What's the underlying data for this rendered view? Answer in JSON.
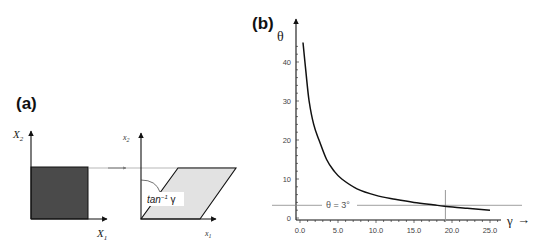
{
  "panel_a": {
    "label": "(a)",
    "left_axes": {
      "y_label": "X",
      "y_sub": "2",
      "x_label": "X",
      "x_sub": "1"
    },
    "right_axes": {
      "y_label": "x",
      "y_sub": "2",
      "x_label": "x",
      "x_sub": "1"
    },
    "angle_label": "tan",
    "angle_sup": "−1",
    "angle_var": " γ",
    "colors": {
      "square_fill": "#4a4a4a",
      "parallelogram_fill": "#e2e2e2",
      "stroke": "#111111"
    }
  },
  "panel_b": {
    "label": "(b)",
    "y_axis_label": "θ",
    "x_axis_label": "γ",
    "x_arrow": "→",
    "annotation": "θ = 3°"
  },
  "chart_data": {
    "type": "line",
    "title": "",
    "xlabel": "γ",
    "ylabel": "θ",
    "x_ticks": [
      "0.0",
      "5.0",
      "10.0",
      "15.0",
      "20.0",
      "25.0"
    ],
    "y_ticks": [
      "0",
      "10",
      "20",
      "30",
      "40"
    ],
    "xlim": [
      0,
      27
    ],
    "ylim": [
      0,
      48
    ],
    "grid": false,
    "legend": null,
    "series": [
      {
        "name": "θ vs γ",
        "x": [
          0.4,
          0.8,
          1.2,
          1.8,
          2.5,
          3.5,
          4.5,
          5.5,
          7.5,
          10.0,
          12.5,
          15.0,
          17.5,
          19.0,
          22.0,
          25.0
        ],
        "y": [
          45,
          37,
          30,
          24,
          20,
          15,
          12,
          10,
          7.5,
          5.8,
          4.8,
          4.0,
          3.4,
          3.0,
          2.5,
          2.0
        ]
      }
    ],
    "annotations": [
      {
        "type": "hline",
        "y": 3,
        "label": "θ = 3°"
      },
      {
        "type": "vline",
        "x": 19
      }
    ]
  }
}
